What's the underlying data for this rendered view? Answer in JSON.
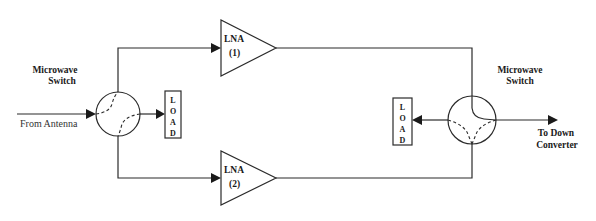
{
  "diagram": {
    "input_label": "From Antenna",
    "output_label_line1": "To Down",
    "output_label_line2": "Converter",
    "switch_left": {
      "label_line1": "Microwave",
      "label_line2": "Switch",
      "load_letters": [
        "L",
        "O",
        "A",
        "D"
      ]
    },
    "switch_right": {
      "label_line1": "Microwave",
      "label_line2": "Switch",
      "load_letters": [
        "L",
        "O",
        "A",
        "D"
      ]
    },
    "lna_1": {
      "name": "LNA",
      "index": "(1)"
    },
    "lna_2": {
      "name": "LNA",
      "index": "(2)"
    },
    "colors": {
      "line": "#2b2b2b",
      "background": "#ffffff"
    }
  }
}
